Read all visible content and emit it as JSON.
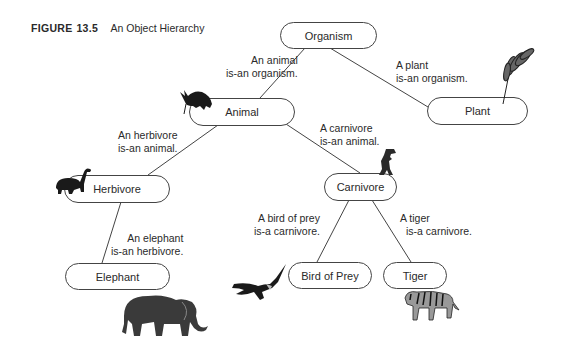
{
  "figure": {
    "number_label": "FIGURE",
    "number": "13.5",
    "title": "An Object Hierarchy"
  },
  "nodes": {
    "organism": "Organism",
    "plant": "Plant",
    "animal": "Animal",
    "herbivore": "Herbivore",
    "carnivore": "Carnivore",
    "elephant": "Elephant",
    "bird_of_prey": "Bird of Prey",
    "tiger": "Tiger"
  },
  "edge_labels": {
    "animal_organism": [
      "An animal",
      "is-an organism."
    ],
    "plant_organism": [
      "A plant",
      "is-an organism."
    ],
    "herbivore_animal": [
      "An herbivore",
      "is-an animal."
    ],
    "carnivore_animal": [
      "A carnivore",
      "is-an animal."
    ],
    "elephant_herbivore": [
      "An elephant",
      "is-an herbivore."
    ],
    "bird_carnivore": [
      "A bird of prey",
      "is-a carnivore."
    ],
    "tiger_carnivore": [
      "A tiger",
      "is-a carnivore."
    ]
  },
  "illustrations": [
    "armadillo-icon",
    "wheat-icon",
    "dinosaur-icon",
    "tyrannosaurus-icon",
    "elephant-icon",
    "eagle-icon",
    "tiger-icon"
  ]
}
